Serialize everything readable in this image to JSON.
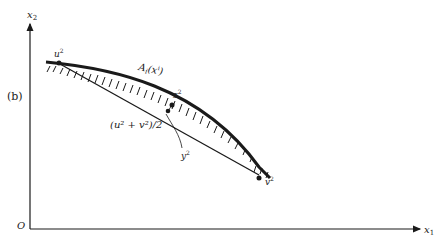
{
  "figure": {
    "panel_label": "(b)",
    "axes": {
      "x_label": "x",
      "x_sub": "1",
      "y_label": "x",
      "y_sub": "2",
      "origin_label": "O"
    },
    "curve_label": {
      "main": "A",
      "sub": "i",
      "arg": "(x",
      "arg_sup": "i",
      "close": ")"
    },
    "points": {
      "u": {
        "label": "u",
        "sup": "2"
      },
      "z": {
        "label": "z",
        "sup": "2"
      },
      "v": {
        "label": "v",
        "sup": "2"
      },
      "y": {
        "label": "y",
        "sup": "2"
      }
    },
    "midpoint_label": "(u² + v²)/2",
    "colors": {
      "ink": "#1a1a1a",
      "background": "#ffffff"
    }
  }
}
